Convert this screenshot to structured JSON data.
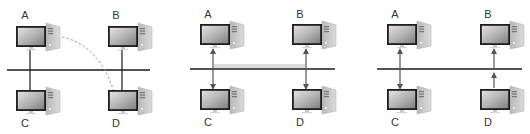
{
  "diagram": {
    "colors": {
      "bus": "#1a1a1a",
      "link": "#2a2a2a",
      "arrow": "#555555",
      "dashed": "#999999",
      "monitor_frame": "#1e1e1e",
      "screen_light": "#d8d8d8",
      "screen_dark": "#8a8a8a",
      "tower": "#c9c9c9"
    },
    "panels": [
      {
        "id": "panel-1",
        "bus": {
          "x1": 7,
          "x2": 150,
          "y": 70
        },
        "nodes": [
          {
            "label": "A",
            "x": 16,
            "y": 26,
            "label_x": 21,
            "label_y": 12
          },
          {
            "label": "B",
            "x": 108,
            "y": 26,
            "label_x": 112,
            "label_y": 12
          },
          {
            "label": "C",
            "x": 16,
            "y": 90,
            "label_x": 21,
            "label_y": 120
          },
          {
            "label": "D",
            "x": 108,
            "y": 90,
            "label_x": 112,
            "label_y": 120
          }
        ],
        "links": [
          {
            "x": 30,
            "y1": 47,
            "y2": 90,
            "style": "plain"
          },
          {
            "x": 122,
            "y1": 47,
            "y2": 90,
            "style": "plain"
          }
        ],
        "dashed_path": "M62 37 Q100 45 115 95"
      },
      {
        "id": "panel-2",
        "bus": {
          "x1": 190,
          "x2": 335,
          "y": 69
        },
        "nodes": [
          {
            "label": "A",
            "x": 200,
            "y": 24,
            "label_x": 204,
            "label_y": 11
          },
          {
            "label": "B",
            "x": 292,
            "y": 24,
            "label_x": 296,
            "label_y": 11
          },
          {
            "label": "C",
            "x": 200,
            "y": 89,
            "label_x": 204,
            "label_y": 119
          },
          {
            "label": "D",
            "x": 292,
            "y": 89,
            "label_x": 296,
            "label_y": 119
          }
        ],
        "links": [
          {
            "x": 213,
            "y1": 48,
            "y2": 89,
            "style": "arrows-both"
          },
          {
            "x": 306,
            "y1": 48,
            "y2": 89,
            "style": "arrows-both"
          }
        ],
        "parallel_line": {
          "x1": 213,
          "x2": 306,
          "y": 66
        }
      },
      {
        "id": "panel-3",
        "bus": {
          "x1": 377,
          "x2": 522,
          "y": 69
        },
        "nodes": [
          {
            "label": "A",
            "x": 387,
            "y": 24,
            "label_x": 391,
            "label_y": 11
          },
          {
            "label": "B",
            "x": 480,
            "y": 24,
            "label_x": 484,
            "label_y": 11
          },
          {
            "label": "C",
            "x": 387,
            "y": 89,
            "label_x": 391,
            "label_y": 119
          },
          {
            "label": "D",
            "x": 480,
            "y": 89,
            "label_x": 484,
            "label_y": 119
          }
        ],
        "links": [
          {
            "x": 400,
            "y1": 48,
            "y2": 89,
            "style": "arrows-both"
          },
          {
            "x": 494,
            "y1": 48,
            "y2": 89,
            "style": "arrows-up-double"
          }
        ]
      }
    ]
  }
}
